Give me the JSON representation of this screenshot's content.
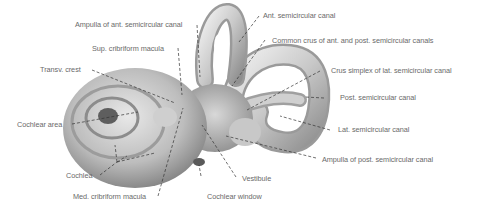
{
  "diagram": {
    "colors": {
      "label_text": "#6a6a6a",
      "leader_line": "#333333",
      "structure_light": "#e4e4e4",
      "structure_dark": "#8a8a8a"
    },
    "labels": [
      {
        "id": "ampulla-ant",
        "text": "Ampulla of ant. semicircular canal"
      },
      {
        "id": "sup-cribriform",
        "text": "Sup. cribriform macula"
      },
      {
        "id": "transv-crest",
        "text": "Transv. crest"
      },
      {
        "id": "cochlear-area",
        "text": "Cochlear area"
      },
      {
        "id": "cochlea",
        "text": "Cochlea"
      },
      {
        "id": "med-cribriform",
        "text": "Med. cribriform macula"
      },
      {
        "id": "cochlear-window",
        "text": "Cochlear window"
      },
      {
        "id": "vestibule",
        "text": "Vestibule"
      },
      {
        "id": "ant-canal",
        "text": "Ant. semicircular canal"
      },
      {
        "id": "common-crus",
        "text": "Common crus of ant. and post. semicircular canals"
      },
      {
        "id": "crus-simplex",
        "text": "Crus simplex of lat. semicircular canal"
      },
      {
        "id": "post-canal",
        "text": "Post. semicircular canal"
      },
      {
        "id": "lat-canal",
        "text": "Lat. semicircular canal"
      },
      {
        "id": "ampulla-post",
        "text": "Ampulla of post. semicircular canal"
      }
    ]
  }
}
